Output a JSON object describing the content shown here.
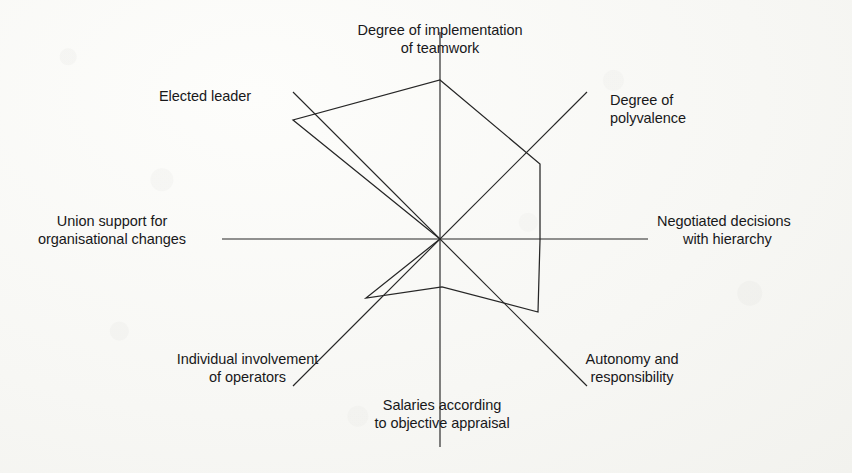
{
  "figure": {
    "type": "radar-diagram",
    "background_color": "#fbfbf9",
    "line_color": "#262626"
  },
  "labels": {
    "teamwork_l1": "Degree of implementation",
    "teamwork_l2": "of teamwork",
    "polyvalence_l1": "Degree of",
    "polyvalence_l2": "polyvalence",
    "negotiated_l1": "Negotiated decisions",
    "negotiated_l2": "with hierarchy",
    "autonomy_l1": "Autonomy and",
    "autonomy_l2": "responsibility",
    "salaries_l1": "Salaries according",
    "salaries_l2": "to objective appraisal",
    "individual_l1": "Individual involvement",
    "individual_l2": "of operators",
    "union_l1": "Union support for",
    "union_l2": "organisational changes",
    "elected_l1": "Elected leader"
  },
  "chart_data": {
    "type": "radar",
    "title": "",
    "subtitle": "",
    "xlabel": "",
    "ylabel": "",
    "grid": false,
    "legend": null,
    "axis_count": 8,
    "axis_start_angle_deg": 90,
    "axis_direction": "clockwise",
    "center": [
      440,
      239
    ],
    "axis_max_radius_px": 208,
    "rlim": [
      0,
      100
    ],
    "categories": [
      "Degree of implementation of teamwork",
      "Degree of polyvalence",
      "Negotiated decisions with hierarchy",
      "Autonomy and responsibility",
      "Salaries according to objective appraisal",
      "Individual involvement of operators",
      "Union support for organisational changes",
      "Elected leader"
    ],
    "series": [
      {
        "name": "Profile",
        "values": [
          77,
          73,
          48,
          72,
          23,
          52,
          0,
          100
        ]
      }
    ],
    "vertices_px": [
      [
        440,
        80
      ],
      [
        540,
        164
      ],
      [
        540,
        240
      ],
      [
        538,
        312
      ],
      [
        442,
        287
      ],
      [
        366,
        298
      ],
      [
        440,
        239
      ],
      [
        293,
        120
      ]
    ],
    "axis_tips_px": [
      [
        440,
        32
      ],
      [
        587,
        92
      ],
      [
        648,
        239
      ],
      [
        587,
        386
      ],
      [
        440,
        447
      ],
      [
        293,
        386
      ],
      [
        222,
        239
      ],
      [
        293,
        92
      ]
    ]
  }
}
